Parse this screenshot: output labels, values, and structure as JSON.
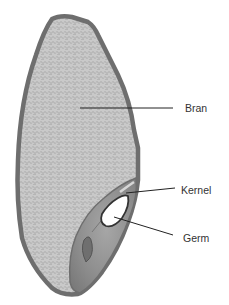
{
  "diagram": {
    "labels": [
      {
        "id": "bran",
        "text": "Bran"
      },
      {
        "id": "kernel",
        "text": "Kernel"
      },
      {
        "id": "germ",
        "text": "Germ"
      }
    ]
  },
  "colors": {
    "outline": "#6e6e6e",
    "bran_fill": "#c9c9c9",
    "bran_texture": "#9a9a9a",
    "germ_region": "#8c8c8c",
    "germ_core": "#ffffff",
    "leader_line": "#222222",
    "label_text": "#333333"
  }
}
